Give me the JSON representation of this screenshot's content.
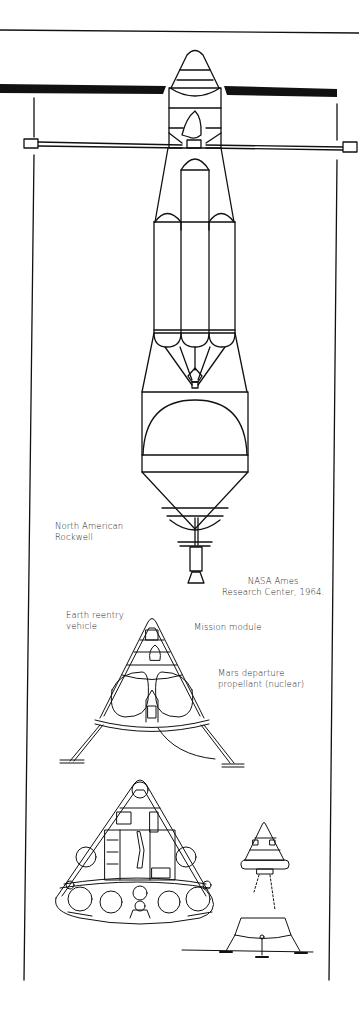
{
  "labels": {
    "maker": {
      "line1": "North American",
      "line2": "Rockwell"
    },
    "credit": {
      "line1": "NASA Ames",
      "line2": "Research Center, 1964."
    },
    "earth_reentry": {
      "line1": "Earth reentry",
      "line2": "vehicle"
    },
    "mission_module": {
      "line1": "Mission module"
    },
    "mars_departure": {
      "line1": "Mars departure",
      "line2": "propellant (nuclear)"
    }
  },
  "colors": {
    "ink": "#111111",
    "paper": "#ffffff",
    "text": "#222222"
  },
  "components": [
    "top-frame-line",
    "solar-panel-left",
    "solar-panel-right",
    "truss-boom",
    "left-frame-line",
    "right-frame-line",
    "nose-cone",
    "crew-module",
    "propellant-tanks",
    "spherical-tank",
    "nozzle",
    "mars-lander-cutaway",
    "reentry-capsule-cutaway",
    "separation-sequence"
  ]
}
